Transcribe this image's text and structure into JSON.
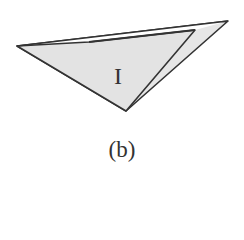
{
  "figure": {
    "region_label": "I",
    "caption": "(b)",
    "colors": {
      "fill": "#e3e3e3",
      "stroke": "#333333",
      "background": "#ffffff"
    }
  }
}
